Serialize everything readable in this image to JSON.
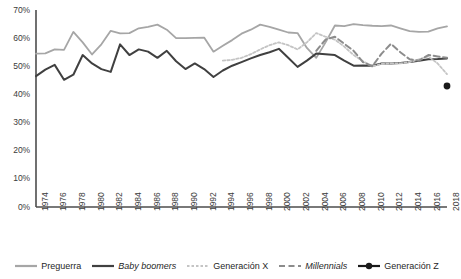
{
  "chart_data": {
    "type": "line",
    "title": "",
    "subtitle": "",
    "xlabel": "",
    "ylabel": "",
    "xlim": [
      1974,
      2018
    ],
    "ylim": [
      0,
      70
    ],
    "grid": false,
    "legend_position": "bottom",
    "y_ticks": [
      "0%",
      "10%",
      "20%",
      "30%",
      "40%",
      "50%",
      "60%",
      "70%"
    ],
    "y_tick_values": [
      0,
      10,
      20,
      30,
      40,
      50,
      60,
      70
    ],
    "x_ticks": [
      "1974",
      "1976",
      "1978",
      "1980",
      "1982",
      "1984",
      "1986",
      "1988",
      "1990",
      "1992",
      "1994",
      "1996",
      "1998",
      "2000",
      "2002",
      "2004",
      "2006",
      "2008",
      "2010",
      "2012",
      "2014",
      "2016",
      "2018"
    ],
    "x_tick_values": [
      1974,
      1976,
      1978,
      1980,
      1982,
      1984,
      1986,
      1988,
      1990,
      1992,
      1994,
      1996,
      1998,
      2000,
      2002,
      2004,
      2006,
      2008,
      2010,
      2012,
      2014,
      2016,
      2018
    ],
    "series": [
      {
        "name": "Preguerra",
        "color": "#a6a6a6",
        "style": "solid",
        "width": 1.8,
        "x": [
          1974,
          1975,
          1976,
          1977,
          1978,
          1979,
          1980,
          1981,
          1982,
          1983,
          1984,
          1985,
          1986,
          1987,
          1988,
          1989,
          1990,
          1991,
          1992,
          1993,
          1994,
          1995,
          1996,
          1997,
          1998,
          1999,
          2000,
          2001,
          2002,
          2003,
          2004,
          2005,
          2006,
          2007,
          2008,
          2009,
          2010,
          2011,
          2012,
          2013,
          2014,
          2015,
          2016,
          2017,
          2018
        ],
        "y": [
          54.5,
          54.6,
          56.0,
          55.8,
          62.2,
          58.5,
          54.2,
          57.8,
          62.6,
          61.7,
          61.8,
          63.5,
          64.0,
          64.8,
          63.0,
          60.0,
          60.0,
          60.1,
          60.2,
          55.2,
          57.3,
          59.3,
          61.6,
          63.0,
          64.8,
          64.0,
          63.0,
          62.0,
          61.8,
          56.5,
          53.0,
          58.5,
          64.5,
          64.3,
          65.0,
          64.6,
          64.4,
          64.3,
          64.5,
          63.5,
          62.5,
          62.2,
          62.3,
          63.5,
          64.2
        ]
      },
      {
        "name": "Baby boomers",
        "color": "#404040",
        "style": "solid",
        "width": 2.0,
        "x": [
          1974,
          1975,
          1976,
          1977,
          1978,
          1979,
          1980,
          1981,
          1982,
          1983,
          1984,
          1985,
          1986,
          1987,
          1988,
          1989,
          1990,
          1991,
          1992,
          1993,
          1994,
          1995,
          1996,
          1997,
          1998,
          1999,
          2000,
          2001,
          2002,
          2003,
          2004,
          2005,
          2006,
          2007,
          2008,
          2009,
          2010,
          2011,
          2012,
          2013,
          2014,
          2015,
          2016,
          2017,
          2018
        ],
        "y": [
          46.5,
          48.8,
          50.5,
          45.2,
          47.0,
          54.0,
          51.0,
          49.0,
          48.0,
          57.8,
          54.0,
          56.0,
          55.2,
          53.0,
          55.5,
          51.8,
          49.0,
          51.0,
          49.0,
          46.2,
          48.5,
          50.2,
          51.5,
          52.8,
          54.0,
          55.0,
          56.2,
          53.0,
          49.8,
          52.0,
          54.5,
          54.3,
          54.0,
          52.0,
          50.2,
          50.3,
          50.2,
          51.0,
          51.0,
          51.2,
          51.5,
          52.0,
          52.5,
          52.6,
          52.8
        ]
      },
      {
        "name": "Generación X",
        "color": "#c4c4c4",
        "style": "dotted",
        "width": 1.8,
        "x": [
          1994,
          1995,
          1996,
          1997,
          1998,
          1999,
          2000,
          2001,
          2002,
          2003,
          2004,
          2005,
          2006,
          2007,
          2008,
          2009,
          2010,
          2011,
          2012,
          2013,
          2014,
          2015,
          2016,
          2017,
          2018
        ],
        "y": [
          52.0,
          52.3,
          53.0,
          54.3,
          56.0,
          57.5,
          58.5,
          57.5,
          56.0,
          58.5,
          61.8,
          60.5,
          59.5,
          57.0,
          54.0,
          51.8,
          50.0,
          50.8,
          51.0,
          51.0,
          51.5,
          52.5,
          53.5,
          51.0,
          47.2
        ]
      },
      {
        "name": "Millennials",
        "color": "#8c8c8c",
        "style": "dashed",
        "width": 2.0,
        "x": [
          2004,
          2005,
          2006,
          2007,
          2008,
          2009,
          2010,
          2011,
          2012,
          2013,
          2014,
          2015,
          2016,
          2017,
          2018
        ],
        "y": [
          55.5,
          59.5,
          60.5,
          58.0,
          55.5,
          51.5,
          50.0,
          54.5,
          58.0,
          55.0,
          52.5,
          52.0,
          54.0,
          53.5,
          53.0
        ]
      },
      {
        "name": "Generación Z",
        "color": "#1a1a1a",
        "style": "marker",
        "width": 2.4,
        "x": [
          2018
        ],
        "y": [
          43.0
        ]
      }
    ]
  },
  "legend": {
    "items": [
      {
        "label": "Preguerra",
        "italic": false,
        "style": "solid",
        "color": "#a6a6a6"
      },
      {
        "label": "Baby boomers",
        "italic": true,
        "style": "solid",
        "color": "#404040"
      },
      {
        "label": "Generación X",
        "italic": false,
        "style": "dotted",
        "color": "#c4c4c4"
      },
      {
        "label": "Millennials",
        "italic": true,
        "style": "dashed",
        "color": "#8c8c8c"
      },
      {
        "label": "Generación Z",
        "italic": false,
        "style": "marker",
        "color": "#1a1a1a"
      }
    ]
  },
  "axis": {
    "line_color": "#4d4d4d"
  }
}
